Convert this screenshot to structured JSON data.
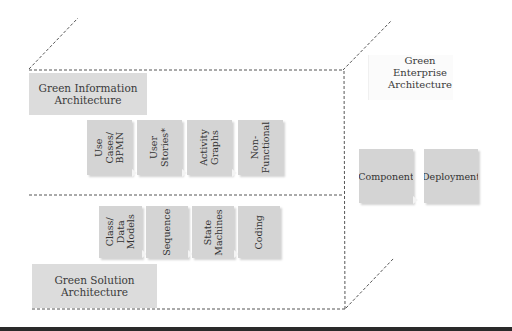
{
  "diagram": {
    "type": "layered architecture cube",
    "colors": {
      "box_fill": "#d4d4d4",
      "label_fill": "#dcdcdc",
      "dashed_line": "#555555",
      "text": "#3a3a3a",
      "bottom_rule": "#2a2a2a"
    },
    "enterprise": {
      "label": "Green\nEnterprise\nArchitecture",
      "steps": [
        {
          "label": "Component"
        },
        {
          "label": "Deployment"
        }
      ]
    },
    "information": {
      "label": "Green Information\nArchitecture",
      "steps": [
        {
          "label": "Use\nCases/\nBPMN"
        },
        {
          "label": "User\nStories*"
        },
        {
          "label": "Activity\nGraphs"
        },
        {
          "label": "Non-\nFunctional"
        }
      ]
    },
    "solution": {
      "label": "Green Solution\nArchitecture",
      "steps": [
        {
          "label": "Class/\nData\nModels"
        },
        {
          "label": "Sequence"
        },
        {
          "label": "State\nMachines"
        },
        {
          "label": "Coding"
        }
      ]
    }
  }
}
